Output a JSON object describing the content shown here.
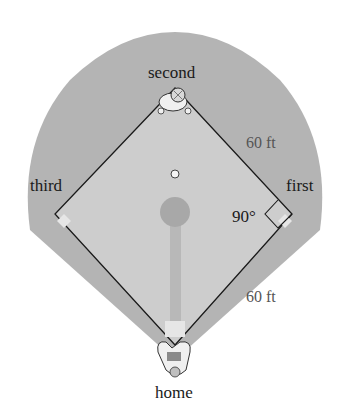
{
  "figure": {
    "type": "baseball-diamond",
    "bases": {
      "second": "second",
      "first": "first",
      "third": "third",
      "home": "home"
    },
    "dimensions": {
      "side_upper_right": "60 ft",
      "side_lower_right": "60 ft",
      "angle_at_first": "90°"
    },
    "colors": {
      "outfield": "#b4b4b4",
      "infield": "#cdcdcd",
      "lines": "#1a1a1a",
      "bases": "#e6e6e6",
      "mound": "#a8a8a8",
      "background": "#ffffff"
    }
  }
}
